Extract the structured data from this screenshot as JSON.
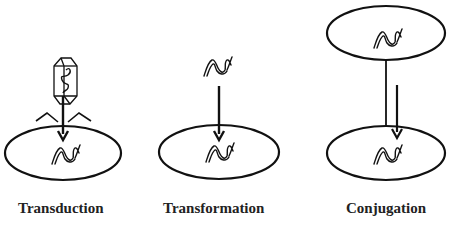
{
  "diagram": {
    "panels": [
      {
        "id": "transduction",
        "label": "Transduction",
        "elements": [
          "bacteriophage",
          "arrow",
          "recipient-cell",
          "dna"
        ]
      },
      {
        "id": "transformation",
        "label": "Transformation",
        "elements": [
          "free-dna",
          "arrow",
          "recipient-cell",
          "dna"
        ]
      },
      {
        "id": "conjugation",
        "label": "Conjugation",
        "elements": [
          "donor-cell",
          "pilus",
          "arrow",
          "recipient-cell",
          "dna"
        ]
      }
    ],
    "colors": {
      "stroke": "#111111",
      "background": "#ffffff",
      "text": "#222222"
    }
  }
}
